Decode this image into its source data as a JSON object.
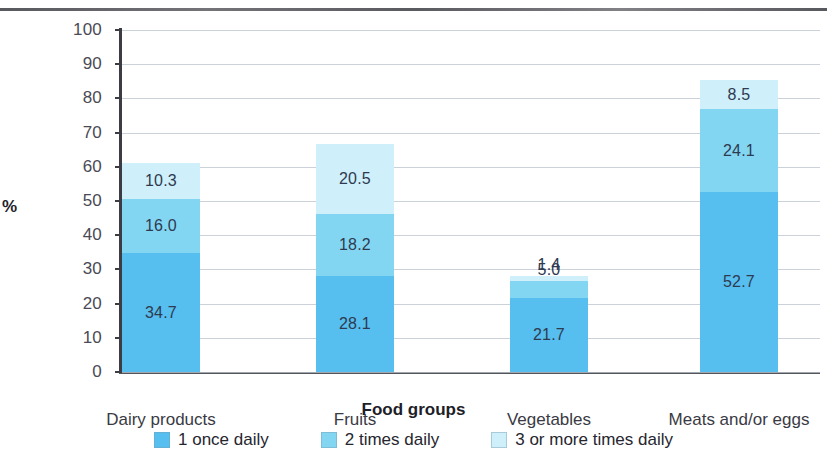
{
  "chart_data": {
    "type": "bar",
    "subtype": "stacked-column",
    "title": "",
    "xlabel": "Food groups",
    "ylabel": "%",
    "ylim": [
      0,
      100
    ],
    "yticks": [
      0,
      10,
      20,
      30,
      40,
      50,
      60,
      70,
      80,
      90,
      100
    ],
    "ytick_labels": [
      "0",
      "10",
      "20",
      "30",
      "40",
      "50",
      "60",
      "70",
      "80",
      "90",
      "100"
    ],
    "grid": true,
    "legend_position": "bottom",
    "categories": [
      "Dairy products",
      "Fruits",
      "Vegetables",
      "Meats and/or eggs"
    ],
    "series": [
      {
        "name": "1 once daily",
        "color": "#56BFEF",
        "values": [
          34.7,
          28.1,
          21.7,
          52.7
        ],
        "labels": [
          "34.7",
          "28.1",
          "21.7",
          "52.7"
        ]
      },
      {
        "name": "2 times daily",
        "color": "#83D6F2",
        "values": [
          16.0,
          18.2,
          5.0,
          24.1
        ],
        "labels": [
          "16.0",
          "18.2",
          "5.0",
          "24.1"
        ]
      },
      {
        "name": "3 or more times daily",
        "color": "#CFEFFA",
        "values": [
          10.3,
          20.5,
          1.4,
          8.5
        ],
        "labels": [
          "10.3",
          "20.5",
          "1.4",
          "8.5"
        ]
      }
    ],
    "totals": [
      61.0,
      66.8,
      28.1,
      85.3
    ]
  },
  "axes": {
    "y_label": "%",
    "x_label": "Food groups"
  },
  "legend": {
    "items": [
      {
        "label": "1 once daily",
        "color": "#56BFEF"
      },
      {
        "label": "2 times daily",
        "color": "#83D6F2"
      },
      {
        "label": "3 or more times daily",
        "color": "#CFEFFA"
      }
    ]
  }
}
